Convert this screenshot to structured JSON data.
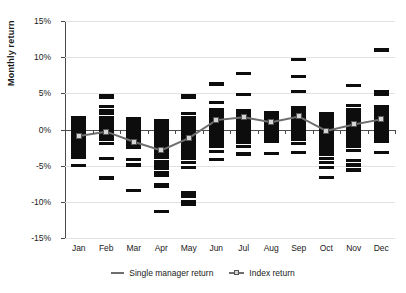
{
  "chart_data": {
    "type": "scatter",
    "title": "",
    "xlabel": "",
    "ylabel": "Monthly return",
    "categories": [
      "Jan",
      "Feb",
      "Mar",
      "Apr",
      "May",
      "Jun",
      "Jul",
      "Aug",
      "Sep",
      "Oct",
      "Nov",
      "Dec"
    ],
    "ylim": [
      -15,
      15
    ],
    "ytick_values": [
      15,
      10,
      5,
      0,
      -5,
      -10,
      -15
    ],
    "ytick_labels": [
      "15%",
      "10%",
      "5%",
      "0%",
      "-5%",
      "-10%",
      "-15%"
    ],
    "grid": true,
    "legend_position": "bottom",
    "legend": [
      {
        "name": "Single manager return",
        "marker": "line",
        "color": "#6e6e6e"
      },
      {
        "name": "Index return",
        "marker": "line-square",
        "color": "#6e6e6e"
      }
    ],
    "note_units": "percent",
    "series": [
      {
        "name": "Single manager return",
        "type": "scatter-dashes",
        "description": "Individual manager monthly returns, plotted as short horizontal dashes per month",
        "points_by_month": {
          "Jan": [
            1.6,
            1.3,
            1.0,
            0.7,
            0.4,
            0.1,
            -0.3,
            -0.7,
            -1.1,
            -1.5,
            -1.9,
            -2.3,
            -2.7,
            -3.1,
            -3.5,
            -3.9,
            -5.0
          ],
          "Feb": [
            4.7,
            4.4,
            3.2,
            2.6,
            2.2,
            1.6,
            1.3,
            1.0,
            0.6,
            0.2,
            -0.2,
            -0.6,
            -1.0,
            -1.4,
            -1.9,
            -4.0,
            -6.7
          ],
          "Mar": [
            1.5,
            1.2,
            0.8,
            0.4,
            0.0,
            -0.4,
            -0.8,
            -1.2,
            -1.6,
            -2.0,
            -2.5,
            -4.2,
            -4.9,
            -8.4
          ],
          "Apr": [
            1.2,
            0.9,
            0.5,
            0.1,
            -0.3,
            -0.7,
            -1.1,
            -1.5,
            -1.9,
            -2.3,
            -2.7,
            -3.1,
            -3.5,
            -3.9,
            -4.4,
            -4.9,
            -5.4,
            -5.9,
            -6.4,
            -7.6,
            -7.9,
            -11.3
          ],
          "May": [
            4.7,
            4.4,
            2.2,
            1.6,
            1.2,
            0.8,
            0.4,
            0.0,
            -0.4,
            -0.8,
            -1.2,
            -1.6,
            -2.0,
            -2.4,
            -2.8,
            -3.2,
            -3.6,
            -4.0,
            -4.6,
            -5.3,
            -8.7,
            -9.2,
            -9.9,
            -10.3
          ],
          "Jun": [
            6.3,
            3.7,
            2.8,
            2.4,
            2.0,
            1.6,
            1.2,
            0.8,
            0.4,
            0.0,
            -0.4,
            -0.8,
            -1.2,
            -1.6,
            -2.0,
            -2.4,
            -3.0,
            -4.2
          ],
          "Jul": [
            7.7,
            4.8,
            2.6,
            2.2,
            1.8,
            1.4,
            1.0,
            0.6,
            0.2,
            -0.2,
            -0.6,
            -1.0,
            -1.4,
            -1.8,
            -2.3,
            -3.4
          ],
          "Aug": [
            2.4,
            2.0,
            1.6,
            1.2,
            0.8,
            0.4,
            0.0,
            -0.4,
            -0.8,
            -1.2,
            -1.7,
            -3.3
          ],
          "Sep": [
            9.7,
            7.3,
            5.2,
            3.0,
            2.6,
            2.2,
            1.8,
            1.4,
            1.0,
            0.6,
            0.2,
            -0.2,
            -0.6,
            -1.0,
            -1.4,
            -1.9,
            -3.2
          ],
          "Oct": [
            2.2,
            1.8,
            1.4,
            1.0,
            0.6,
            0.2,
            -0.2,
            -0.6,
            -1.0,
            -1.4,
            -1.8,
            -2.2,
            -2.6,
            -3.0,
            -3.5,
            -4.0,
            -4.6,
            -5.2,
            -6.6
          ],
          "Nov": [
            6.1,
            3.3,
            2.8,
            2.4,
            2.0,
            1.6,
            1.2,
            0.8,
            0.4,
            0.0,
            -0.4,
            -0.8,
            -1.2,
            -1.6,
            -2.0,
            -2.4,
            -2.9,
            -4.3,
            -4.9,
            -5.6
          ],
          "Dec": [
            11.0,
            5.3,
            4.9,
            3.2,
            2.8,
            2.4,
            2.0,
            1.6,
            1.2,
            0.8,
            0.4,
            0.0,
            -0.4,
            -0.8,
            -1.2,
            -1.7,
            -3.2
          ]
        }
      },
      {
        "name": "Index return",
        "type": "line",
        "color": "#6e6e6e",
        "values": [
          -0.9,
          -0.3,
          -1.7,
          -2.9,
          -1.2,
          1.3,
          1.7,
          1.0,
          1.8,
          -0.2,
          0.7,
          1.4
        ]
      }
    ]
  }
}
